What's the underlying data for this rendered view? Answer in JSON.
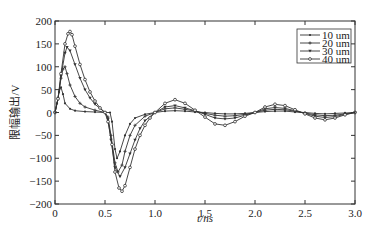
{
  "chart_data": {
    "type": "line",
    "title": "",
    "xlabel": "t/ns",
    "ylabel": "限幅输出/V",
    "xlim": [
      0,
      3.0
    ],
    "ylim": [
      -200,
      200
    ],
    "xticks": [
      "0",
      "0.5",
      "1.0",
      "1.5",
      "2.0",
      "2.5",
      "3.0"
    ],
    "yticks": [
      "200",
      "150",
      "100",
      "50",
      "0",
      "-50",
      "-100",
      "-150",
      "-200"
    ],
    "grid": false,
    "legend_position": "upper right",
    "series": [
      {
        "name": "10 um",
        "marker": "dot",
        "x": [
          0,
          0.02,
          0.04,
          0.06,
          0.08,
          0.1,
          0.15,
          0.2,
          0.3,
          0.4,
          0.5,
          0.55,
          0.57,
          0.6,
          0.62,
          0.65,
          0.7,
          0.75,
          0.8,
          0.9,
          1.0,
          1.1,
          1.2,
          1.3,
          1.4,
          1.5,
          1.6,
          1.7,
          1.8,
          1.9,
          2.0,
          2.1,
          2.2,
          2.3,
          2.4,
          2.5,
          2.6,
          2.7,
          2.8,
          2.9,
          3.0
        ],
        "y": [
          0,
          20,
          45,
          55,
          40,
          20,
          8,
          4,
          2,
          1,
          0,
          0,
          -20,
          -80,
          -100,
          -85,
          -50,
          -25,
          -12,
          -4,
          0,
          3,
          4,
          3,
          1,
          0,
          -2,
          -3,
          -3,
          -2,
          0,
          2,
          3,
          3,
          1,
          0,
          -2,
          -3,
          -2,
          -1,
          0
        ]
      },
      {
        "name": "20 um",
        "marker": "plus",
        "x": [
          0,
          0.03,
          0.06,
          0.08,
          0.1,
          0.12,
          0.15,
          0.2,
          0.25,
          0.3,
          0.4,
          0.5,
          0.53,
          0.56,
          0.6,
          0.63,
          0.67,
          0.7,
          0.75,
          0.8,
          0.9,
          1.0,
          1.1,
          1.2,
          1.3,
          1.4,
          1.5,
          1.6,
          1.7,
          1.8,
          1.9,
          2.0,
          2.1,
          2.2,
          2.3,
          2.4,
          2.5,
          2.6,
          2.7,
          2.8,
          2.9,
          3.0
        ],
        "y": [
          0,
          30,
          75,
          95,
          100,
          85,
          60,
          35,
          20,
          12,
          5,
          0,
          -10,
          -50,
          -110,
          -130,
          -115,
          -85,
          -50,
          -28,
          -8,
          0,
          8,
          10,
          7,
          3,
          -2,
          -6,
          -8,
          -7,
          -4,
          0,
          5,
          7,
          6,
          3,
          -1,
          -5,
          -7,
          -6,
          -3,
          0
        ]
      },
      {
        "name": "30 um",
        "marker": "triangle-down",
        "x": [
          0,
          0.03,
          0.06,
          0.1,
          0.12,
          0.15,
          0.2,
          0.25,
          0.3,
          0.35,
          0.4,
          0.5,
          0.53,
          0.56,
          0.6,
          0.65,
          0.7,
          0.75,
          0.8,
          0.85,
          0.9,
          1.0,
          1.1,
          1.2,
          1.3,
          1.4,
          1.5,
          1.6,
          1.7,
          1.8,
          1.9,
          2.0,
          2.1,
          2.2,
          2.3,
          2.4,
          2.5,
          2.6,
          2.7,
          2.8,
          2.9,
          3.0
        ],
        "y": [
          0,
          30,
          80,
          130,
          143,
          135,
          105,
          75,
          50,
          32,
          18,
          0,
          -15,
          -60,
          -120,
          -140,
          -120,
          -90,
          -60,
          -35,
          -18,
          0,
          12,
          15,
          10,
          4,
          -4,
          -12,
          -14,
          -12,
          -6,
          0,
          8,
          11,
          9,
          4,
          -2,
          -8,
          -11,
          -9,
          -4,
          0
        ]
      },
      {
        "name": "40 um",
        "marker": "circle",
        "x": [
          0,
          0.03,
          0.06,
          0.1,
          0.13,
          0.15,
          0.17,
          0.2,
          0.25,
          0.3,
          0.35,
          0.4,
          0.45,
          0.5,
          0.53,
          0.57,
          0.6,
          0.64,
          0.67,
          0.7,
          0.75,
          0.8,
          0.85,
          0.9,
          0.95,
          1.0,
          1.1,
          1.2,
          1.3,
          1.4,
          1.5,
          1.6,
          1.7,
          1.8,
          1.9,
          2.0,
          2.1,
          2.2,
          2.3,
          2.4,
          2.5,
          2.6,
          2.7,
          2.8,
          2.9,
          3.0
        ],
        "y": [
          0,
          30,
          85,
          150,
          172,
          177,
          170,
          145,
          105,
          72,
          45,
          25,
          10,
          0,
          -20,
          -70,
          -130,
          -165,
          -172,
          -160,
          -120,
          -80,
          -50,
          -28,
          -12,
          0,
          20,
          28,
          20,
          5,
          -10,
          -25,
          -28,
          -20,
          -8,
          0,
          12,
          18,
          15,
          6,
          -3,
          -12,
          -16,
          -12,
          -5,
          0
        ]
      }
    ]
  },
  "legend": {
    "items": [
      "10 um",
      "20 um",
      "30 um",
      "40 um"
    ]
  }
}
